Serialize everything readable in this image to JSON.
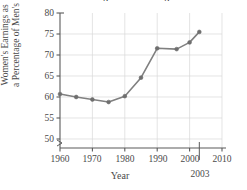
{
  "chart_data": {
    "type": "line",
    "title": "Women's Earnings as a Percentage of Men's",
    "xlabel": "Year",
    "ylabel_line1": "Women's Earnings as",
    "ylabel_line2": "a Percentage of Men's",
    "x": [
      1960,
      1965,
      1970,
      1975,
      1980,
      1985,
      1990,
      1996,
      2000,
      2003
    ],
    "values": [
      60.7,
      60.0,
      59.4,
      58.8,
      60.2,
      64.6,
      71.6,
      71.4,
      73.0,
      75.5
    ],
    "series": [
      {
        "name": "Women's earnings as a percentage of men's",
        "values": [
          60.7,
          60.0,
          59.4,
          58.8,
          60.2,
          64.6,
          71.6,
          71.4,
          73.0,
          75.5
        ]
      }
    ],
    "xlim": [
      1960,
      2010
    ],
    "ylim": [
      48,
      80
    ],
    "xticks": [
      1960,
      1970,
      1980,
      1990,
      2000,
      2010
    ],
    "xtick_labels": [
      "1960",
      "1970",
      "1980",
      "1990",
      "2000",
      "2010"
    ],
    "yticks": [
      50,
      55,
      60,
      65,
      70,
      75,
      80
    ],
    "ytick_labels": [
      "50",
      "55",
      "60",
      "65",
      "70",
      "75",
      "80"
    ],
    "grid": true,
    "legend": "none",
    "axis_break": true,
    "annotations": [
      {
        "text": "2003",
        "x": 2003,
        "placement": "below-axis"
      }
    ],
    "colors": {
      "line": "#808080",
      "marker": "#6e6e6e",
      "grid": "#d8d8d8",
      "axis": "#5a5a5a",
      "text": "#4a4a4a"
    }
  }
}
